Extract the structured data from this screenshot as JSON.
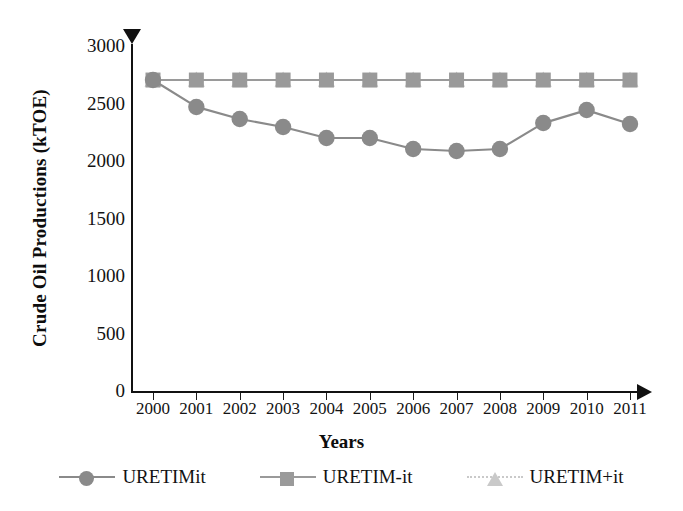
{
  "chart_data": {
    "type": "line",
    "title": "",
    "xlabel": "Years",
    "ylabel": "Crude Oil Productions (kTOE)",
    "x": [
      2000,
      2001,
      2002,
      2003,
      2004,
      2005,
      2006,
      2007,
      2008,
      2009,
      2010,
      2011
    ],
    "categories": [
      "2000",
      "2001",
      "2002",
      "2003",
      "2004",
      "2005",
      "2006",
      "2007",
      "2008",
      "2009",
      "2010",
      "2011"
    ],
    "ylim": [
      0,
      3000
    ],
    "yticks": [
      0,
      500,
      1000,
      1500,
      2000,
      2500,
      3000
    ],
    "ytick_labels": [
      "0",
      "500",
      "1000",
      "1500",
      "2000",
      "2500",
      "3000"
    ],
    "grid": false,
    "legend_position": "bottom",
    "series": [
      {
        "name": "URETIMit",
        "marker": "circle",
        "color": "#8a8a8a",
        "line_style": "solid",
        "values": [
          2704,
          2470,
          2365,
          2296,
          2200,
          2200,
          2104,
          2087,
          2104,
          2330,
          2443,
          2322
        ]
      },
      {
        "name": "URETIM-it",
        "marker": "square",
        "color": "#9a9a9a",
        "line_style": "solid",
        "values": [
          2704,
          2704,
          2704,
          2704,
          2704,
          2704,
          2704,
          2704,
          2704,
          2704,
          2704,
          2704
        ]
      },
      {
        "name": "URETIM+it",
        "marker": "triangle",
        "color": "#c9c9c9",
        "line_style": "dotted",
        "values": [
          2704,
          2704,
          2704,
          2704,
          2704,
          2704,
          2704,
          2704,
          2704,
          2704,
          2704,
          2704
        ]
      }
    ]
  },
  "axes": {
    "y_title": "Crude Oil Productions (kTOE)",
    "x_title": "Years",
    "y_arrow_icon": "triangle-down-icon",
    "x_arrow_icon": "triangle-right-icon"
  },
  "legend": {
    "items": [
      {
        "label": "URETIMit",
        "marker": "circle-marker",
        "color": "#8a8a8a",
        "line": "solid"
      },
      {
        "label": "URETIM-it",
        "marker": "square-marker",
        "color": "#9a9a9a",
        "line": "solid"
      },
      {
        "label": "URETIM+it",
        "marker": "triangle-marker",
        "color": "#c9c9c9",
        "line": "dotted"
      }
    ]
  },
  "colors": {
    "axis": "#111111",
    "series_1": "#8a8a8a",
    "series_2": "#9a9a9a",
    "series_3": "#c9c9c9",
    "background": "#ffffff"
  }
}
